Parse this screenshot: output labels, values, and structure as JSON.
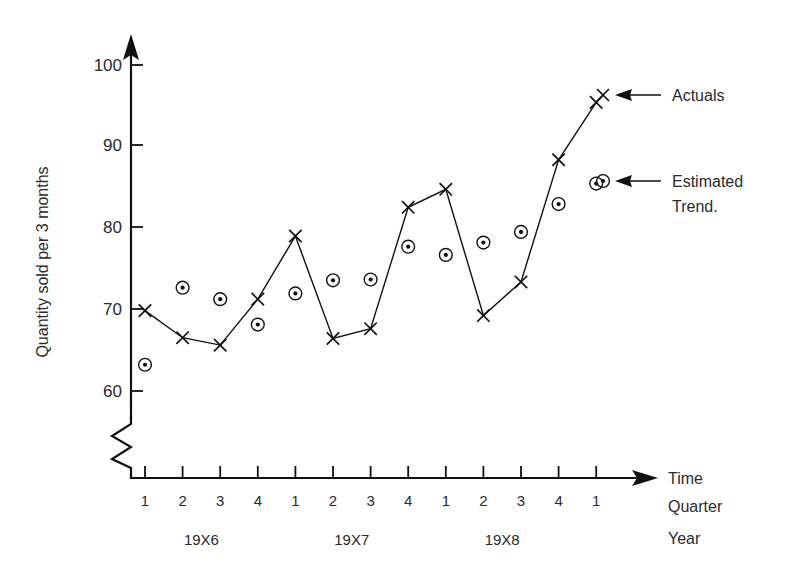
{
  "chart_data": {
    "type": "line",
    "title": "",
    "xlabel": "Time Quarter Year",
    "ylabel": "Quantity sold per 3 months",
    "ylim": [
      55,
      102
    ],
    "yticks": [
      60,
      70,
      80,
      90,
      100
    ],
    "y_axis_break": true,
    "grid": false,
    "legend_position": "right",
    "x_quarters": [
      "1",
      "2",
      "3",
      "4",
      "1",
      "2",
      "3",
      "4",
      "1",
      "2",
      "3",
      "4",
      "1"
    ],
    "x_years": [
      "19X6",
      "19X7",
      "19X8"
    ],
    "x_index": [
      1,
      2,
      3,
      4,
      5,
      6,
      7,
      8,
      9,
      10,
      11,
      12,
      13
    ],
    "series": [
      {
        "name": "Actuals",
        "marker": "x",
        "line": true,
        "values": [
          69.8,
          66.5,
          65.6,
          71.2,
          78.9,
          66.4,
          67.6,
          82.4,
          84.6,
          69.2,
          73.3,
          88.2,
          95.2
        ]
      },
      {
        "name": "Estimated Trend.",
        "marker": "circle-dot",
        "line": false,
        "values": [
          63.2,
          72.6,
          71.2,
          68.1,
          71.9,
          73.5,
          73.6,
          77.6,
          76.6,
          78.1,
          79.4,
          82.8,
          85.3
        ]
      }
    ]
  },
  "axes": {
    "y_label": "Quantity sold per 3 months",
    "y_ticks": [
      "100",
      "90",
      "80",
      "70",
      "60"
    ],
    "x_tick_labels": [
      "1",
      "2",
      "3",
      "4",
      "1",
      "2",
      "3",
      "4",
      "1",
      "2",
      "3",
      "4",
      "1"
    ],
    "year_labels": [
      "19X6",
      "19X7",
      "19X8"
    ],
    "corner_labels": [
      "Time",
      "Quarter",
      "Year"
    ]
  },
  "legend": {
    "items": [
      {
        "label": "Actuals",
        "marker": "x-marker"
      },
      {
        "label": "Estimated",
        "label2": "Trend.",
        "marker": "circle-dot-marker"
      }
    ]
  },
  "colors": {
    "ink": "#111111",
    "text": "#2a2a2a",
    "background": "#ffffff"
  }
}
